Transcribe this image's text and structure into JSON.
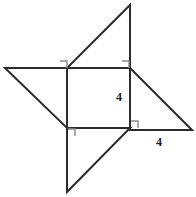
{
  "figure": {
    "name": "pinwheel-square-with-four-right-triangles",
    "background_color": "#ffffff",
    "stroke_color": "#2b2b2b",
    "right_angle_marker_color": "#8a8a8a",
    "stroke_width": 2,
    "canvas": {
      "width": 196,
      "height": 197
    },
    "central_square": {
      "name": "central-square",
      "top_left": [
        67,
        68
      ],
      "top_right": [
        130,
        68
      ],
      "bottom_right": [
        130,
        128
      ],
      "bottom_left": [
        67,
        128
      ],
      "points": "67,68 130,68 130,128 67,128"
    },
    "triangles": [
      {
        "name": "top-triangle",
        "points": "130,5 130,68 67,68",
        "right_angle_at": [
          130,
          68
        ]
      },
      {
        "name": "left-triangle",
        "points": "5,68 67,68 67,128",
        "right_angle_at": [
          67,
          68
        ]
      },
      {
        "name": "right-triangle",
        "points": "130,68 192,130 130,130",
        "right_angle_at": [
          130,
          130
        ]
      },
      {
        "name": "bottom-triangle",
        "points": "67,128 67,192 130,128",
        "right_angle_at": [
          67,
          128
        ]
      }
    ],
    "right_angle_markers": [
      {
        "name": "right-angle-marker-top-left",
        "points": "60,61 67,61 67,68"
      },
      {
        "name": "right-angle-marker-top-right",
        "points": "122,61 129,61 129,68"
      },
      {
        "name": "right-angle-marker-bottom-left",
        "points": "68,129 75,129 75,136"
      },
      {
        "name": "right-angle-marker-bottom-right",
        "points": "131,121 138,121 138,128"
      }
    ],
    "labels": [
      {
        "name": "side-length-label-vertical",
        "text": "4",
        "x": 119,
        "y": 101,
        "anchor": "middle"
      },
      {
        "name": "side-length-label-horizontal",
        "text": "4",
        "x": 159,
        "y": 146,
        "anchor": "middle"
      }
    ]
  }
}
